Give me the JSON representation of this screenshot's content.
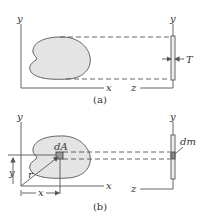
{
  "figure_a": {
    "caption": "(a)",
    "labels": {
      "y_left": "y",
      "y_right": "y",
      "x": "x",
      "z": "z",
      "thickness": "T"
    }
  },
  "figure_b": {
    "caption": "(b)",
    "labels": {
      "y_left": "y",
      "y_right": "y",
      "x": "x",
      "z": "z",
      "area_element": "dA",
      "mass_element": "dm",
      "radius": "r",
      "y_dim": "y",
      "x_dim": "x"
    }
  },
  "colors": {
    "line": "#555555",
    "fill": "#e4e4e4",
    "text": "#333333"
  }
}
